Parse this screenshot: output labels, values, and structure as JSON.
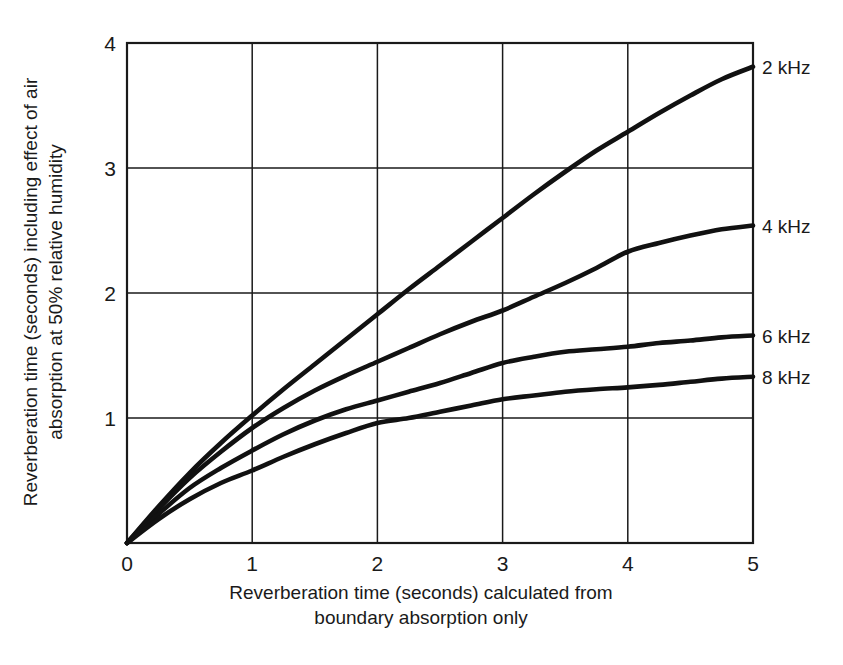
{
  "chart_data": {
    "type": "line",
    "title": "",
    "xlabel": "Reverberation time (seconds) calculated from boundary absorption only",
    "xlabel_line1": "Reverberation time (seconds) calculated from",
    "xlabel_line2": "boundary absorption only",
    "ylabel": "Reverberation time (seconds) including effect of air absorption at 50% relative humidity",
    "ylabel_line1": "Reverberation time (seconds) including effect of air",
    "ylabel_line2": "absorption at 50% relative humidity",
    "xlim": [
      0,
      5
    ],
    "ylim": [
      0,
      4
    ],
    "xticks": [
      "0",
      "1",
      "2",
      "3",
      "4",
      "5"
    ],
    "yticks": [
      "1",
      "2",
      "3",
      "4"
    ],
    "xtick_values": [
      0,
      1,
      2,
      3,
      4,
      5
    ],
    "ytick_values": [
      1,
      2,
      3,
      4
    ],
    "grid": true,
    "legend_position": "right-end-of-line",
    "line_color": "#111111",
    "axis_color": "#1a1a1a",
    "x": [
      0,
      0.25,
      0.5,
      0.75,
      1,
      1.25,
      1.5,
      1.75,
      2,
      2.25,
      2.5,
      2.75,
      3,
      3.25,
      3.5,
      3.75,
      4,
      4.25,
      4.5,
      4.75,
      5
    ],
    "series": [
      {
        "name": "2 kHz",
        "label": "2 kHz",
        "values": [
          0,
          0.29,
          0.56,
          0.8,
          1.02,
          1.23,
          1.43,
          1.63,
          1.83,
          2.03,
          2.22,
          2.41,
          2.6,
          2.79,
          2.97,
          3.14,
          3.29,
          3.44,
          3.58,
          3.71,
          3.81
        ]
      },
      {
        "name": "4 kHz",
        "label": "4 kHz",
        "values": [
          0,
          0.27,
          0.52,
          0.73,
          0.92,
          1.08,
          1.22,
          1.34,
          1.45,
          1.56,
          1.67,
          1.77,
          1.86,
          1.97,
          2.08,
          2.2,
          2.33,
          2.4,
          2.46,
          2.51,
          2.54
        ]
      },
      {
        "name": "6 kHz",
        "label": "6 kHz",
        "values": [
          0,
          0.23,
          0.44,
          0.6,
          0.74,
          0.87,
          0.98,
          1.07,
          1.14,
          1.21,
          1.28,
          1.36,
          1.44,
          1.49,
          1.53,
          1.55,
          1.57,
          1.6,
          1.62,
          1.645,
          1.66
        ]
      },
      {
        "name": "8 kHz",
        "label": "8 kHz",
        "values": [
          0,
          0.19,
          0.35,
          0.48,
          0.58,
          0.69,
          0.79,
          0.88,
          0.96,
          1.0,
          1.05,
          1.1,
          1.15,
          1.18,
          1.21,
          1.23,
          1.245,
          1.265,
          1.29,
          1.315,
          1.33
        ]
      }
    ]
  },
  "axis": {
    "x_tick_labels": [
      "0",
      "1",
      "2",
      "3",
      "4",
      "5"
    ],
    "y_tick_labels": [
      "1",
      "2",
      "3",
      "4"
    ]
  }
}
